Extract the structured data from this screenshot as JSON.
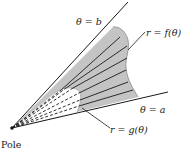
{
  "diagram": {
    "colors": {
      "region_fill": "#c4c4c4",
      "inner_region_fill": "#ffffff",
      "line": "#1a1a1a",
      "text": "#222222"
    },
    "labels": {
      "ray_b": "θ = b",
      "ray_a": "θ = a",
      "outer_curve": "r = f(θ)",
      "inner_curve": "r = g(θ)",
      "pole": "Pole"
    },
    "pole": {
      "x": 12,
      "y": 128
    }
  }
}
